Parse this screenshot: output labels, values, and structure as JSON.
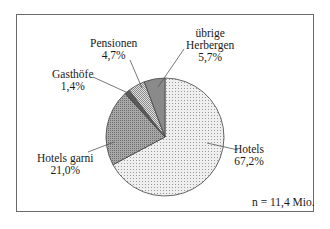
{
  "chart_data": {
    "type": "pie",
    "title": "",
    "slices": [
      {
        "label": "Hotels",
        "value": 67.2,
        "value_text": "67,2%",
        "pattern": "light-dots"
      },
      {
        "label": "Hotels garni",
        "value": 21.0,
        "value_text": "21,0%",
        "pattern": "dense-crosshatch"
      },
      {
        "label": "Gasthöfe",
        "value": 1.4,
        "value_text": "1,4%",
        "pattern": "dark"
      },
      {
        "label": "Pensionen",
        "value": 4.7,
        "value_text": "4,7%",
        "pattern": "checker"
      },
      {
        "label": "übrige Herbergen",
        "value": 5.7,
        "value_text": "5,7%",
        "pattern": "dark-gray"
      }
    ],
    "annotation": "n = 11,4 Mio.",
    "legend": "none (direct labels with leader lines)"
  },
  "labels": {
    "hotels": {
      "name": "Hotels",
      "pct": "67,2%"
    },
    "garni": {
      "name": "Hotels garni",
      "pct": "21,0%"
    },
    "gasthoefe": {
      "name": "Gasthöfe",
      "pct": "1,4%"
    },
    "pensionen": {
      "name": "Pensionen",
      "pct": "4,7%"
    },
    "uebrige": {
      "name1": "übrige",
      "name2": "Herbergen",
      "pct": "5,7%"
    },
    "n": "n = 11,4 Mio."
  }
}
